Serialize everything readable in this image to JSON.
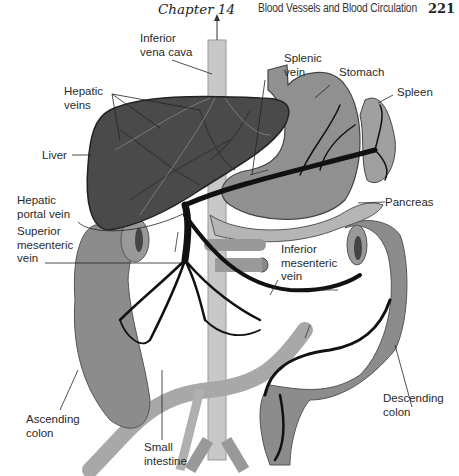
{
  "header": {
    "chapter": "Chapter 14",
    "section_title": "Blood Vessels and Blood Circulation",
    "page_number": "221"
  },
  "figure": {
    "labels": {
      "inferior_vena_cava": "Inferior\nvena cava",
      "hepatic_veins": "Hepatic\nveins",
      "liver": "Liver",
      "hepatic_portal_vein": "Hepatic\nportal vein",
      "superior_mesenteric_vein": "Superior\nmesenteric\nvein",
      "splenic_vein": "Splenic\nvein",
      "stomach": "Stomach",
      "spleen": "Spleen",
      "pancreas": "Pancreas",
      "inferior_mesenteric_vein": "Inferior\nmesenteric\nvein",
      "ascending_colon": "Ascending\ncolon",
      "small_intestine": "Small\nintestine",
      "descending_colon": "Descending\ncolon"
    },
    "colors": {
      "liver": "#4a4a4a",
      "organ": "#8c8c8c",
      "organ_light": "#b5b5b5",
      "vein": "#111111",
      "vena_cava": "#c8c8c8"
    }
  }
}
